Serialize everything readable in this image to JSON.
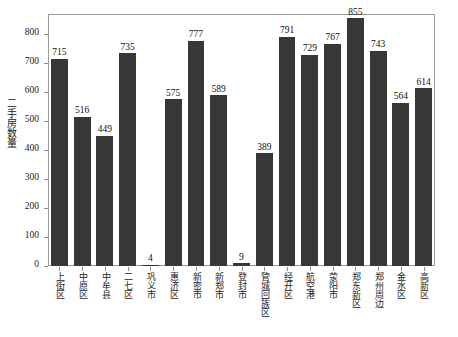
{
  "chart_data": {
    "type": "bar",
    "title": "",
    "xlabel": "",
    "ylabel": "二手房数量",
    "ylim": [
      0,
      870
    ],
    "grid": false,
    "legend": null,
    "bar_color": "#373737",
    "frame_color": "#9a9a9a",
    "y_ticks": [
      0,
      100,
      200,
      300,
      400,
      500,
      600,
      700,
      800
    ],
    "y_tick_labels": [
      "0",
      "100",
      "200",
      "300",
      "400",
      "500",
      "600",
      "700",
      "800"
    ],
    "categories": [
      "上街区",
      "中原区",
      "中牟县",
      "二七区",
      "巩义市",
      "惠济区",
      "新密市",
      "新郑市",
      "登封市",
      "管城回族区",
      "经开区",
      "航空港",
      "荥阳市",
      "郑东新区",
      "郑州周边",
      "金水区",
      "高新区"
    ],
    "values": [
      715,
      516,
      449,
      735,
      4,
      575,
      777,
      589,
      9,
      389,
      791,
      729,
      767,
      855,
      743,
      564,
      614
    ],
    "value_labels": [
      "715",
      "516",
      "449",
      "735",
      "4",
      "575",
      "777",
      "589",
      "9",
      "389",
      "791",
      "729",
      "767",
      "855",
      "743",
      "564",
      "614"
    ]
  }
}
